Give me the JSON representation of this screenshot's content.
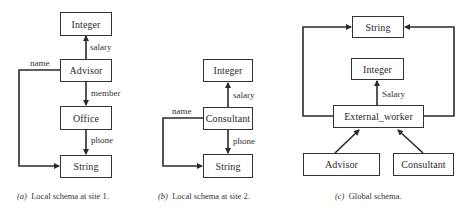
{
  "diagrams": {
    "a": {
      "caption_tag": "(a)",
      "caption": "Local schema at site 1.",
      "nodes": {
        "integer": "Integer",
        "advisor": "Advisor",
        "office": "Office",
        "string": "String"
      },
      "edges": {
        "salary": "salary",
        "name": "name",
        "member": "member",
        "phone": "phone"
      }
    },
    "b": {
      "caption_tag": "(b)",
      "caption": "Local schema at site 2.",
      "nodes": {
        "integer": "Integer",
        "consultant": "Consultant",
        "string": "String"
      },
      "edges": {
        "salary": "salary",
        "name": "name",
        "phone": "phone"
      }
    },
    "c": {
      "caption_tag": "(c)",
      "caption": "Global schema.",
      "nodes": {
        "string": "String",
        "integer": "Integer",
        "external_worker": "External_worker",
        "advisor": "Advisor",
        "consultant": "Consultant"
      },
      "edges": {
        "salary": "Salary"
      }
    }
  },
  "colors": {
    "line": "#2a2a2a",
    "box_border": "#333333",
    "background": "#ffffff"
  }
}
